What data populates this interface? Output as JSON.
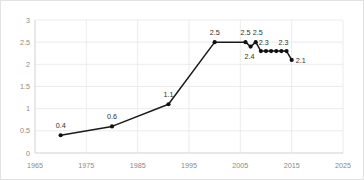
{
  "chart_data": {
    "type": "line",
    "title": "",
    "subtitle": "",
    "xlabel": "",
    "ylabel": "",
    "xlim": [
      1965,
      2025
    ],
    "ylim": [
      0,
      3
    ],
    "grid": true,
    "legend": "none",
    "xticks": [
      "1965",
      "1975",
      "1985",
      "1995",
      "2005",
      "2015",
      "2025"
    ],
    "xtick_values": [
      1965,
      1975,
      1985,
      1995,
      2005,
      2015,
      2025
    ],
    "yticks": [
      "0",
      "0.5",
      "1",
      "1.5",
      "2",
      "2.5",
      "3"
    ],
    "ytick_values": [
      0,
      0.5,
      1,
      1.5,
      2,
      2.5,
      3
    ],
    "marker": "filled-circle",
    "line_color": "#1a1a1a",
    "grid_color": "#e6e6e6",
    "series": [
      {
        "name": "",
        "x": [
          1970,
          1980,
          1991,
          2000,
          2006,
          2007,
          2008,
          2009,
          2010,
          2011,
          2012,
          2013,
          2014,
          2015
        ],
        "values": [
          0.4,
          0.6,
          1.1,
          2.5,
          2.5,
          2.4,
          2.5,
          2.3,
          2.3,
          2.3,
          2.3,
          2.3,
          2.3,
          2.1
        ]
      }
    ],
    "point_labels": [
      {
        "x": 1970,
        "y": 0.4,
        "text": "0.4",
        "dx": 0,
        "dy": -7
      },
      {
        "x": 1980,
        "y": 0.6,
        "text": "0.6",
        "dx": 0,
        "dy": -7
      },
      {
        "x": 1991,
        "y": 1.1,
        "text": "1.1",
        "dx": 0,
        "dy": -7
      },
      {
        "x": 2000,
        "y": 2.5,
        "text": "2.5",
        "dx": 0,
        "dy": -7
      },
      {
        "x": 2006,
        "y": 2.5,
        "text": "2.5",
        "dx": 0,
        "dy": -7
      },
      {
        "x": 2007,
        "y": 2.4,
        "text": "2.4",
        "dx": -1,
        "dy": 12
      },
      {
        "x": 2008,
        "y": 2.5,
        "text": "2.5",
        "dx": 2,
        "dy": -7
      },
      {
        "x": 2009,
        "y": 2.3,
        "text": "2.3",
        "dx": 3,
        "dy": -6
      },
      {
        "x": 2013,
        "y": 2.3,
        "text": "2.3",
        "dx": 2,
        "dy": -6
      },
      {
        "x": 2015,
        "y": 2.1,
        "text": "2.1",
        "dx": 9,
        "dy": 3
      }
    ]
  }
}
